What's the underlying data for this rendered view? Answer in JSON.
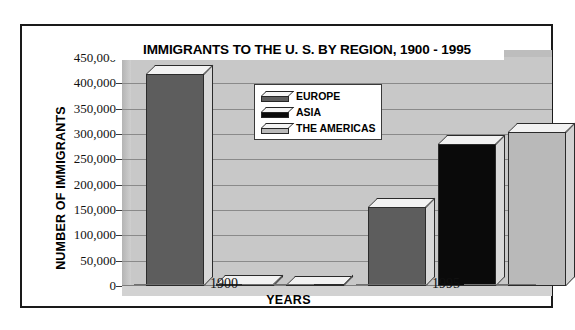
{
  "chart_data": {
    "type": "bar",
    "title": "IMMIGRANTS TO THE U. S. BY REGION, 1900 - 1995",
    "xlabel": "YEARS",
    "ylabel": "NUMBER OF IMMIGRANTS",
    "categories": [
      "1900",
      "1995"
    ],
    "series": [
      {
        "name": "EUROPE",
        "values": [
          418000,
          155000
        ],
        "color": "#5d5d5d"
      },
      {
        "name": "ASIA",
        "values": [
          3000,
          280000
        ],
        "color": "#0a0a0a"
      },
      {
        "name": "THE AMERICAS",
        "values": [
          2000,
          303000
        ],
        "color": "#b9b9b9"
      }
    ],
    "ylim": [
      0,
      450000
    ],
    "ytick_values": [
      450000,
      400000,
      350000,
      300000,
      250000,
      200000,
      150000,
      100000,
      50000,
      0
    ],
    "ytick_labels": [
      "450,000",
      "400,000",
      "350,000",
      "300,000",
      "250,000",
      "200,000",
      "150,000",
      "100,000",
      "50,000",
      "0"
    ],
    "grid": true,
    "legend_position": "upper-center",
    "style": "3d-bar",
    "plot_background": "#c8c8c8"
  },
  "legend": {
    "items": [
      {
        "label": "EUROPE"
      },
      {
        "label": "ASIA"
      },
      {
        "label": "THE AMERICAS"
      }
    ]
  }
}
